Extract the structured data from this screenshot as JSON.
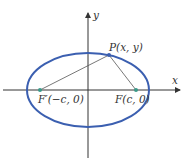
{
  "diagram": {
    "type": "ellipse-with-foci",
    "axes": {
      "x_label": "x",
      "y_label": "y"
    },
    "point_p": {
      "label": "P(x, y)"
    },
    "focus_left": {
      "label": "F′(−c, 0)"
    },
    "focus_right": {
      "label": "F(c, 0)"
    },
    "colors": {
      "ellipse": "#3b5fb0",
      "focus": "#3a9a8a",
      "point": "#3b5fb0",
      "axis": "#333333",
      "segment": "#555555"
    }
  }
}
